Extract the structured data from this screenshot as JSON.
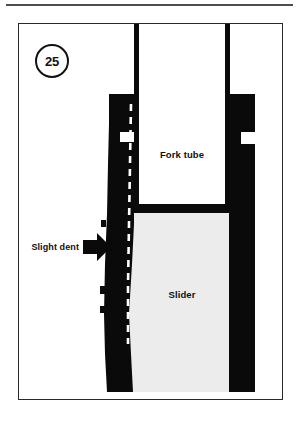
{
  "figure": {
    "number": "25",
    "domain_kind": "technical-cutaway-diagram"
  },
  "labels": {
    "fork_tube": "Fork tube",
    "slider": "Slider",
    "slight_dent": "Slight dent"
  },
  "icons": {
    "callout_arrow": "right-arrow-icon",
    "figure_badge": "circled-number-icon"
  },
  "colors": {
    "ink": "#111111",
    "rule": "#4d4d4d",
    "frame_border": "#2a2a2a",
    "page_background": "#ffffff",
    "fork_tube_fill": "#ffffff",
    "slider_fill": "#ececec",
    "metal_section": "#0a0a0a"
  },
  "geometry": {
    "figure_frame": {
      "x": 18,
      "y": 23,
      "width": 265,
      "height": 377
    },
    "top_rule": {
      "x": 6,
      "y": 4,
      "width": 287,
      "height": 2
    },
    "fork_tube_wall_left_x": 115,
    "fork_tube_wall_right_x": 210,
    "fork_tube_bottom_y": 183,
    "slider_top_y": 70,
    "slider_wall_left": {
      "x": 87,
      "width": 28
    },
    "slider_wall_right": {
      "x": 210,
      "width": 24
    },
    "dent_center_y": 222
  },
  "annotations": {
    "dashed_profile_note": "original undeformed wall profile shown dashed",
    "dent_side": "left"
  }
}
